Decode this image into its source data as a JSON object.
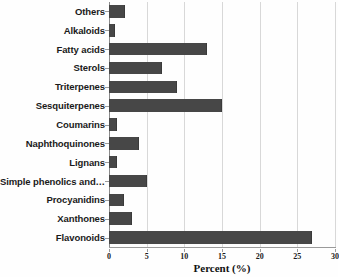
{
  "chart_data": {
    "type": "bar",
    "orientation": "horizontal",
    "title": "",
    "xlabel": "Percent (%)",
    "ylabel": "",
    "xlim": [
      0,
      30
    ],
    "xticks": [
      0,
      5,
      10,
      15,
      20,
      25,
      30
    ],
    "grid": "vertical",
    "legend": "none",
    "bar_color": "#474747",
    "gridline_color": "#d8d8d8",
    "categories": [
      "Others",
      "Alkaloids",
      "Fatty acids",
      "Sterols",
      "Triterpenes",
      "Sesquiterpenes",
      "Coumarins",
      "Naphthoquinones",
      "Lignans",
      "Simple phenolics and…",
      "Procyanidins",
      "Xanthones",
      "Flavonoids"
    ],
    "values": [
      2.1,
      0.8,
      13.0,
      7.0,
      9.0,
      15.0,
      1.0,
      4.0,
      1.0,
      5.0,
      2.0,
      3.0,
      27.0
    ]
  }
}
